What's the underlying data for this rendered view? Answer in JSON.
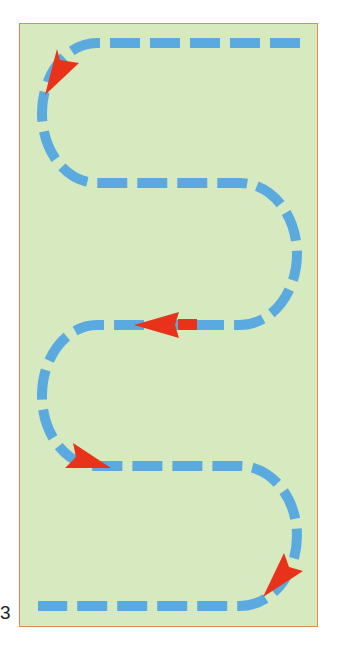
{
  "figure": {
    "number_label": "3",
    "colors": {
      "panel_background": "#D7E9BF",
      "panel_border": "#E8845A",
      "path_dash": "#5AAAE0",
      "arrow": "#E8331A",
      "label_text": "#222222"
    },
    "path": {
      "start": [
        300,
        43
      ],
      "end": [
        38,
        606
      ],
      "rows_y": [
        43,
        183,
        325,
        466,
        606
      ],
      "turns": [
        "left",
        "right",
        "left",
        "right"
      ],
      "dash_width": 10
    },
    "arrows": [
      {
        "name": "arrow-top-left-turn",
        "direction": "down-left",
        "tip": [
          45,
          95
        ]
      },
      {
        "name": "arrow-middle-row",
        "direction": "left",
        "tip": [
          134,
          324
        ]
      },
      {
        "name": "arrow-lower-left-turn",
        "direction": "right",
        "tip": [
          111,
          468
        ]
      },
      {
        "name": "arrow-bottom-right-turn",
        "direction": "down-left",
        "tip": [
          263,
          597
        ]
      }
    ]
  }
}
